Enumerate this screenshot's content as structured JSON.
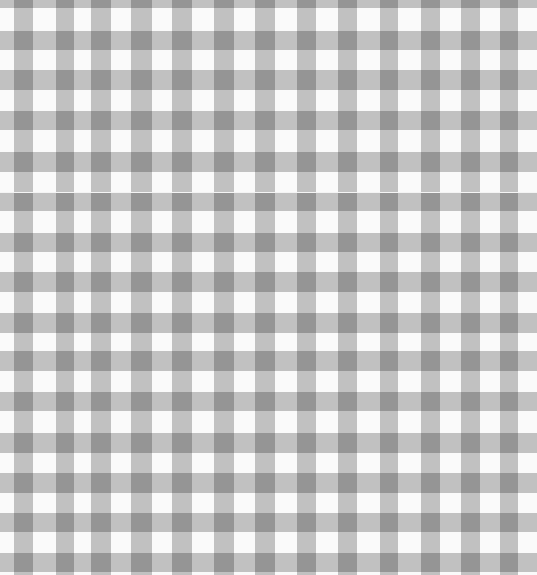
{
  "image": {
    "subject": "gray and white gingham check fabric",
    "width": 537,
    "height": 575,
    "colors": {
      "background": "#fafafa",
      "light_check": "#c4c4c4",
      "dark_check": "#8a8a8a"
    },
    "vertical_stripes": [
      [
        14,
        19
      ],
      [
        56,
        18
      ],
      [
        91,
        20
      ],
      [
        131,
        21
      ],
      [
        172,
        20
      ],
      [
        214,
        20
      ],
      [
        255,
        20
      ],
      [
        297,
        19
      ],
      [
        338,
        19
      ],
      [
        380,
        18
      ],
      [
        421,
        19
      ],
      [
        461,
        19
      ],
      [
        500,
        18
      ]
    ],
    "horizontal_stripes": [
      [
        -10,
        18
      ],
      [
        31,
        19
      ],
      [
        70,
        20
      ],
      [
        111,
        19
      ],
      [
        152,
        20
      ],
      [
        193,
        18
      ],
      [
        233,
        19
      ],
      [
        272,
        20
      ],
      [
        313,
        20
      ],
      [
        351,
        20
      ],
      [
        392,
        19
      ],
      [
        433,
        20
      ],
      [
        473,
        20
      ],
      [
        513,
        19
      ],
      [
        553,
        19
      ]
    ],
    "seam_y": 192
  }
}
